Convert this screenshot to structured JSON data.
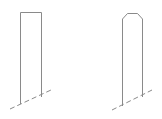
{
  "diagram": {
    "stroke_color": "#8a8a8a",
    "figures": [
      {
        "name": "flat-top-post",
        "shape": "rectangle"
      },
      {
        "name": "chamfered-top-post",
        "shape": "rectangle-with-chamfered-top"
      }
    ]
  }
}
